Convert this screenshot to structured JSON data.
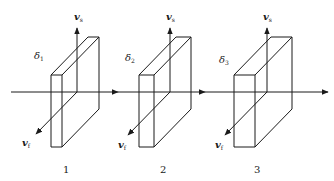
{
  "diagram": {
    "panels": [
      {
        "id": 1,
        "thickness_label": "δ",
        "thickness_sub": "1",
        "vs_label": "v",
        "vs_sub": "s",
        "vf_label": "v",
        "vf_sub": "f",
        "number": "1"
      },
      {
        "id": 2,
        "thickness_label": "δ",
        "thickness_sub": "2",
        "vs_label": "v",
        "vs_sub": "s",
        "vf_label": "v",
        "vf_sub": "f",
        "number": "2"
      },
      {
        "id": 3,
        "thickness_label": "δ",
        "thickness_sub": "3",
        "vs_label": "v",
        "vs_sub": "s",
        "vf_label": "v",
        "vf_sub": "f",
        "number": "3"
      }
    ],
    "colors": {
      "line": "#1a1a1a",
      "background": "#ffffff"
    }
  }
}
